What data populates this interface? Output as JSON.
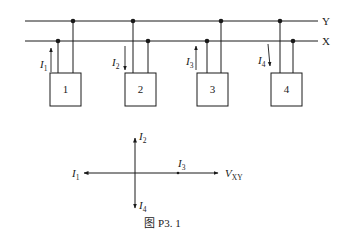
{
  "figure": {
    "caption": "图 P3. 1",
    "buses": [
      {
        "name": "Y",
        "label": "Y"
      },
      {
        "name": "X",
        "label": "X"
      }
    ],
    "units": [
      {
        "label": "1",
        "current": "I",
        "current_sub": "1",
        "current_direction": "up"
      },
      {
        "label": "2",
        "current": "I",
        "current_sub": "2",
        "current_direction": "down"
      },
      {
        "label": "3",
        "current": "I",
        "current_sub": "3",
        "current_direction": "up"
      },
      {
        "label": "4",
        "current": "I",
        "current_sub": "4",
        "current_direction": "down"
      }
    ],
    "phasor_diagram": {
      "reference": {
        "symbol": "V",
        "sub": "XY"
      },
      "I1": {
        "symbol": "I",
        "sub": "1",
        "direction": "left"
      },
      "I2": {
        "symbol": "I",
        "sub": "2",
        "direction": "up"
      },
      "I3": {
        "symbol": "I",
        "sub": "3",
        "direction": "right"
      },
      "I4": {
        "symbol": "I",
        "sub": "4",
        "direction": "down"
      }
    }
  },
  "colors": {
    "line": "#1a1a1a",
    "background": "#ffffff"
  }
}
